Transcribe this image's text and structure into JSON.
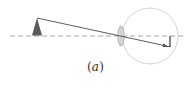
{
  "figure": {
    "caption_open": "(",
    "caption_letter": "a",
    "caption_close": ")"
  },
  "colors": {
    "axis": "#9a9a9a",
    "ray": "#4a4a55",
    "object": "#5a5a5a",
    "eyeball": "#c8c8c8",
    "lens_fill": "#d9d9d9",
    "lens_stroke": "#9a9a9a",
    "image": "#4a4a55"
  }
}
